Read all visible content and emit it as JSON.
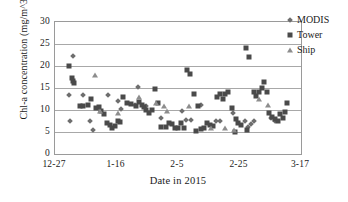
{
  "chart_data": {
    "type": "scatter",
    "title": "",
    "xlabel": "Date in 2015",
    "ylabel": "Chl-a concentration (mg/m^3)",
    "ylim": [
      0,
      30
    ],
    "yticks": [
      0,
      5,
      10,
      15,
      20,
      25,
      30
    ],
    "ytick_labels": [
      "0",
      "5",
      "10",
      "15",
      "20",
      "25",
      "30"
    ],
    "xlim": [
      0,
      80
    ],
    "xticks": [
      0,
      20,
      40,
      60,
      80
    ],
    "xtick_labels": [
      "12-27",
      "1-16",
      "2-5",
      "2-25",
      "3-17"
    ],
    "grid": "horizontal",
    "legend_position": "top-right",
    "series": [
      {
        "name": "MODIS",
        "marker": "diamond",
        "color": "#6e6e6e",
        "points": [
          [
            6.0,
            22.2
          ],
          [
            4.4,
            13.5
          ],
          [
            9.2,
            13.3
          ],
          [
            5.0,
            7.5
          ],
          [
            11.4,
            7.4
          ],
          [
            12.4,
            5.4
          ],
          [
            17.2,
            13.5
          ],
          [
            20.6,
            12.0
          ],
          [
            21.6,
            10.2
          ],
          [
            26.0,
            11.2
          ],
          [
            27.0,
            15.2
          ],
          [
            29.6,
            11.0
          ],
          [
            34.6,
            8.2
          ],
          [
            41.4,
            9.8
          ],
          [
            42.6,
            7.8
          ],
          [
            44.2,
            7.8
          ],
          [
            47.4,
            11.1
          ],
          [
            52.2,
            7.6
          ],
          [
            53.8,
            7.6
          ],
          [
            58.0,
            9.4
          ],
          [
            61.8,
            7.6
          ],
          [
            62.8,
            6.2
          ],
          [
            63.8,
            6.8
          ],
          [
            64.6,
            7.4
          ],
          [
            70.4,
            8.1
          ],
          [
            71.4,
            7.4
          ]
        ]
      },
      {
        "name": "Tower",
        "marker": "square",
        "color": "#4a4a4a",
        "points": [
          [
            4.4,
            20.0
          ],
          [
            5.4,
            17.2
          ],
          [
            5.8,
            16.6
          ],
          [
            6.2,
            16.2
          ],
          [
            8.0,
            11.0
          ],
          [
            9.0,
            11.0
          ],
          [
            10.6,
            11.2
          ],
          [
            11.6,
            12.6
          ],
          [
            13.2,
            10.4
          ],
          [
            14.2,
            10.6
          ],
          [
            15.0,
            9.8
          ],
          [
            15.8,
            9.1
          ],
          [
            16.8,
            7.0
          ],
          [
            17.8,
            6.6
          ],
          [
            18.6,
            6.0
          ],
          [
            19.6,
            6.4
          ],
          [
            20.4,
            7.4
          ],
          [
            21.0,
            7.2
          ],
          [
            22.0,
            13.0
          ],
          [
            23.4,
            11.6
          ],
          [
            24.8,
            11.4
          ],
          [
            26.2,
            10.8
          ],
          [
            27.4,
            11.9
          ],
          [
            28.2,
            11.2
          ],
          [
            28.8,
            10.6
          ],
          [
            29.6,
            10.0
          ],
          [
            30.6,
            9.4
          ],
          [
            31.6,
            10.0
          ],
          [
            32.6,
            14.8
          ],
          [
            33.6,
            11.6
          ],
          [
            34.6,
            6.2
          ],
          [
            36.2,
            6.2
          ],
          [
            37.0,
            7.1
          ],
          [
            38.0,
            6.8
          ],
          [
            39.0,
            6.0
          ],
          [
            40.0,
            5.8
          ],
          [
            41.0,
            7.0
          ],
          [
            41.8,
            6.0
          ],
          [
            43.0,
            19.0
          ],
          [
            44.0,
            18.2
          ],
          [
            45.2,
            13.6
          ],
          [
            46.4,
            11.0
          ],
          [
            47.6,
            5.6
          ],
          [
            48.6,
            6.0
          ],
          [
            49.4,
            7.0
          ],
          [
            50.4,
            6.6
          ],
          [
            51.4,
            6.4
          ],
          [
            52.6,
            13.0
          ],
          [
            53.6,
            13.6
          ],
          [
            54.6,
            12.6
          ],
          [
            55.4,
            13.6
          ],
          [
            56.4,
            14.0
          ],
          [
            57.6,
            10.4
          ],
          [
            58.4,
            4.9
          ],
          [
            59.6,
            7.0
          ],
          [
            60.6,
            6.6
          ],
          [
            62.0,
            24.0
          ],
          [
            63.0,
            22.0
          ],
          [
            64.6,
            14.0
          ],
          [
            65.4,
            13.2
          ],
          [
            66.2,
            14.2
          ],
          [
            67.2,
            15.0
          ],
          [
            68.0,
            16.4
          ],
          [
            68.8,
            14.0
          ],
          [
            69.6,
            9.4
          ],
          [
            70.6,
            8.4
          ],
          [
            71.6,
            8.0
          ],
          [
            72.4,
            7.6
          ],
          [
            73.2,
            9.0
          ],
          [
            74.0,
            8.2
          ],
          [
            74.8,
            9.6
          ],
          [
            75.6,
            11.6
          ],
          [
            62.4,
            5.4
          ],
          [
            59.0,
            8.0
          ],
          [
            46.0,
            5.2
          ]
        ]
      },
      {
        "name": "Ship",
        "marker": "triangle",
        "color": "#8d8d8d",
        "points": [
          [
            13.0,
            18.0
          ],
          [
            14.6,
            9.8
          ],
          [
            20.4,
            9.4
          ],
          [
            27.4,
            13.0
          ],
          [
            33.0,
            11.6
          ],
          [
            35.6,
            11.0
          ],
          [
            36.4,
            9.8
          ],
          [
            43.6,
            10.8
          ],
          [
            50.8,
            5.8
          ],
          [
            55.2,
            6.0
          ],
          [
            58.2,
            5.4
          ],
          [
            66.4,
            12.6
          ],
          [
            69.4,
            11.2
          ]
        ]
      }
    ]
  }
}
